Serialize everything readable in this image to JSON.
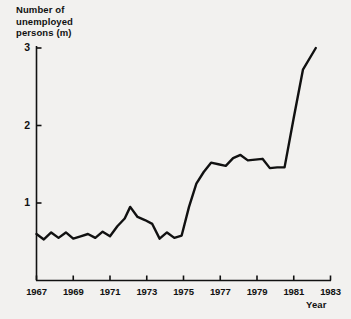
{
  "chart_data": {
    "type": "line",
    "title": "",
    "ylabel": "Number of\nunemployed\npersons (m)",
    "xlabel": "Year",
    "grid": false,
    "legend": "none",
    "xlim": [
      1967,
      1983
    ],
    "ylim": [
      0,
      3.15
    ],
    "yticks": [
      1,
      2,
      3
    ],
    "ytick_labels": [
      "1",
      "2",
      "3"
    ],
    "xticks": [
      1967,
      1969,
      1971,
      1973,
      1975,
      1977,
      1979,
      1981,
      1983
    ],
    "xtick_labels": [
      "1967",
      "1969",
      "1971",
      "1973",
      "1975",
      "1977",
      "1979",
      "1981",
      "1983"
    ],
    "xticks_minor": [
      1968,
      1970,
      1972,
      1974,
      1976,
      1978,
      1980,
      1982
    ],
    "line_color": "#111111",
    "line_width": 2.4,
    "series": [
      {
        "name": "Number of unemployed persons (m)",
        "x": [
          1967.0,
          1967.4,
          1967.8,
          1968.2,
          1968.6,
          1969.0,
          1969.4,
          1969.8,
          1970.2,
          1970.6,
          1971.0,
          1971.4,
          1971.8,
          1972.1,
          1972.5,
          1972.9,
          1973.3,
          1973.7,
          1974.1,
          1974.5,
          1974.9,
          1975.3,
          1975.7,
          1976.1,
          1976.5,
          1976.9,
          1977.3,
          1977.7,
          1978.1,
          1978.5,
          1978.9,
          1979.3,
          1979.7,
          1980.1,
          1980.5,
          1981.0,
          1981.5,
          1982.2
        ],
        "y": [
          0.6,
          0.53,
          0.62,
          0.55,
          0.62,
          0.54,
          0.57,
          0.6,
          0.55,
          0.63,
          0.57,
          0.7,
          0.8,
          0.95,
          0.82,
          0.78,
          0.73,
          0.54,
          0.62,
          0.55,
          0.58,
          0.95,
          1.25,
          1.4,
          1.52,
          1.5,
          1.48,
          1.58,
          1.62,
          1.55,
          1.56,
          1.57,
          1.45,
          1.46,
          1.46,
          2.1,
          2.72,
          3.0
        ]
      }
    ]
  },
  "axes": {
    "y_title": "Number of\nunemployed\npersons (m)",
    "x_title": "Year"
  }
}
